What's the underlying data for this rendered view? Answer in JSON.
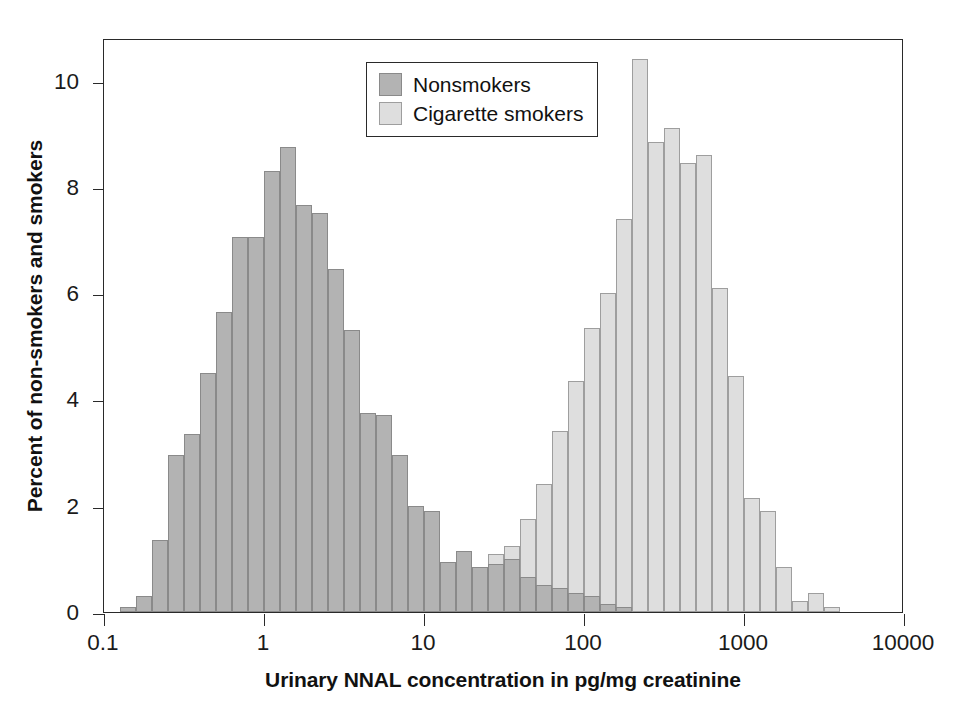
{
  "chart_data": {
    "type": "bar",
    "title": "",
    "xlabel": "Urinary NNAL concentration in pg/mg creatinine",
    "ylabel": "Percent of non-smokers and smokers",
    "xscale": "log",
    "xlim": [
      0.1,
      10000
    ],
    "ylim": [
      0,
      10.8
    ],
    "yticks": [
      0,
      2,
      4,
      6,
      8,
      10
    ],
    "xticks": [
      0.1,
      1,
      10,
      100,
      1000,
      10000
    ],
    "xtick_labels": [
      "0.1",
      "1",
      "10",
      "100",
      "1000",
      "10000"
    ],
    "grid": false,
    "legend_position": "upper center",
    "bin_width_decades": 0.1,
    "series": [
      {
        "name": "Nonsmokers",
        "color": "#b3b3b3",
        "bin_left_edges": [
          0.1259,
          0.1585,
          0.1995,
          0.2512,
          0.3162,
          0.3981,
          0.5012,
          0.631,
          0.7943,
          1.0,
          1.2589,
          1.5849,
          1.9953,
          2.5119,
          3.1623,
          3.9811,
          5.0119,
          6.3096,
          7.9433,
          10.0,
          12.589,
          15.849,
          19.953,
          25.119,
          31.623,
          39.811,
          50.119,
          63.096,
          79.433,
          100.0,
          125.89,
          158.49
        ],
        "values": [
          0.1,
          0.3,
          1.35,
          2.95,
          3.35,
          4.5,
          5.65,
          7.05,
          7.05,
          8.3,
          8.75,
          7.65,
          7.5,
          6.45,
          5.3,
          3.75,
          3.7,
          2.95,
          2.0,
          1.9,
          0.95,
          1.15,
          0.85,
          0.9,
          1.0,
          0.65,
          0.5,
          0.45,
          0.35,
          0.3,
          0.15,
          0.1
        ]
      },
      {
        "name": "Cigarette smokers",
        "color": "#dedede",
        "bin_left_edges": [
          10.0,
          12.589,
          15.849,
          19.953,
          25.119,
          31.623,
          39.811,
          50.119,
          63.096,
          79.433,
          100.0,
          125.89,
          158.49,
          199.53,
          251.19,
          316.23,
          398.11,
          501.19,
          630.96,
          794.33,
          1000.0,
          1258.9,
          1584.9,
          1995.3,
          2511.9,
          3162.3
        ],
        "values": [
          0.1,
          0.15,
          0.2,
          0.3,
          1.1,
          1.25,
          1.75,
          2.4,
          3.4,
          4.35,
          5.35,
          6.0,
          7.4,
          10.4,
          8.85,
          9.1,
          8.45,
          8.6,
          6.1,
          4.45,
          2.15,
          1.9,
          0.85,
          0.2,
          0.35,
          0.1
        ]
      }
    ]
  },
  "legend": {
    "items": [
      {
        "label": "Nonsmokers",
        "swatch": "nonsmoker"
      },
      {
        "label": "Cigarette smokers",
        "swatch": "smoker"
      }
    ]
  },
  "axes": {
    "y_title": "Percent of non-smokers and smokers",
    "x_title": "Urinary NNAL concentration in pg/mg creatinine",
    "y_tick_labels": [
      "0",
      "2",
      "4",
      "6",
      "8",
      "10"
    ],
    "x_tick_labels": [
      "0.1",
      "1",
      "10",
      "100",
      "1000",
      "10000"
    ]
  },
  "colors": {
    "nonsmoker": "#b3b3b3",
    "smoker": "#dedede",
    "axis": "#2a2a2a",
    "text": "#111111",
    "background": "#ffffff"
  }
}
